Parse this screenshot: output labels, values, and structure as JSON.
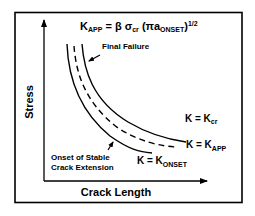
{
  "figure": {
    "equation": {
      "K": "K",
      "K_sub": "APP",
      "rest1": " = β σ",
      "sigma_sub": "cr",
      "rest2": " (πa",
      "a_sub": "ONSET",
      "rest3": ")",
      "exponent": "1/2"
    },
    "axes": {
      "ylabel": "Stress",
      "xlabel": "Crack Length"
    },
    "annotations": {
      "final_failure": "Final Failure",
      "onset_line1": "Onset of Stable",
      "onset_line2": "Crack Extension"
    },
    "curve_labels": {
      "kcr_main": "K = K",
      "kcr_sub": "cr",
      "kapp_main": "K = K",
      "kapp_sub": "APP",
      "konset_main": "K = K",
      "konset_sub": "ONSET"
    },
    "curves": [
      {
        "name": "K = Kcr",
        "style": "solid"
      },
      {
        "name": "K = KAPP",
        "style": "dashed"
      },
      {
        "name": "K = KONSET",
        "style": "solid"
      }
    ]
  }
}
